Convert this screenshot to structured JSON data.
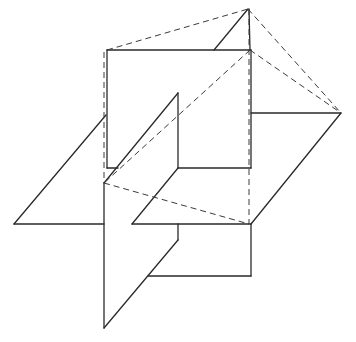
{
  "diagram": {
    "title": "",
    "colors": {
      "background": "#ffffff",
      "line": "#2a2a2a",
      "dashed": "#3a3a3a"
    },
    "vertices": {
      "apex": [
        248,
        9
      ],
      "right_point": [
        341,
        113
      ],
      "left_point": [
        14,
        224
      ],
      "bottom_point": [
        104,
        328
      ],
      "front_square_tl": [
        107,
        50
      ],
      "front_square_tr": [
        251,
        50
      ],
      "center_junction": [
        104,
        183
      ],
      "lower_right_corner": [
        251,
        224
      ]
    },
    "solid_segments": [
      [
        107,
        50,
        251,
        50
      ],
      [
        107,
        50,
        107,
        168
      ],
      [
        107,
        168,
        118,
        168
      ],
      [
        178,
        93,
        178,
        168
      ],
      [
        178,
        168,
        251,
        168
      ],
      [
        251,
        50,
        251,
        168
      ],
      [
        248,
        9,
        214,
        50
      ],
      [
        249,
        9,
        250,
        50
      ],
      [
        251,
        113,
        341,
        113
      ],
      [
        341,
        113,
        251,
        224
      ],
      [
        14,
        224,
        106,
        115
      ],
      [
        14,
        224,
        104,
        224
      ],
      [
        104,
        183,
        104,
        328
      ],
      [
        104,
        183,
        178,
        93
      ],
      [
        104,
        328,
        178,
        240
      ],
      [
        132,
        224,
        251,
        224
      ],
      [
        132,
        224,
        178,
        168
      ],
      [
        178,
        224,
        178,
        240
      ],
      [
        148,
        276,
        251,
        276
      ],
      [
        251,
        224,
        251,
        276
      ]
    ],
    "dashed_segments": [
      [
        107,
        50,
        248,
        9
      ],
      [
        248,
        9,
        341,
        113
      ],
      [
        250,
        50,
        341,
        113
      ],
      [
        250,
        50,
        104,
        183
      ],
      [
        104,
        183,
        249,
        224
      ],
      [
        104,
        52,
        104,
        183
      ],
      [
        249,
        9,
        249,
        224
      ]
    ]
  }
}
